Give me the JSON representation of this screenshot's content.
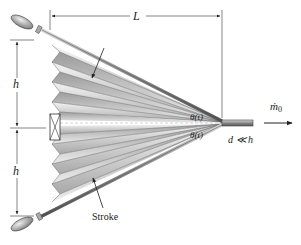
{
  "figure": {
    "type": "bellows-diagram",
    "labels": {
      "length": "L",
      "height_top": "h",
      "height_bottom": "h",
      "angle_top": "θ(t)",
      "angle_bottom": "θ(t)",
      "mass_flow": "ṁ",
      "mass_flow_sub": "0",
      "nozzle_condition": "d ≪ h",
      "stroke": "Stroke"
    },
    "colors": {
      "line": "#333333",
      "rod": "#8a8a8a",
      "pleat_light": "#f2f2f2",
      "pleat_dark": "#9a9a9a"
    }
  }
}
